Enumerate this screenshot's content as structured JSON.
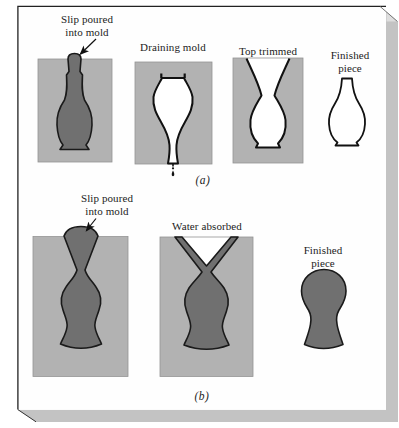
{
  "figure": {
    "row_a": {
      "panels": [
        {
          "label": "Slip poured\ninto mold"
        },
        {
          "label": "Draining mold"
        },
        {
          "label": "Top trimmed"
        },
        {
          "label": "Finished\npiece"
        }
      ],
      "caption": "(a)"
    },
    "row_b": {
      "panels": [
        {
          "label": "Slip poured\ninto mold"
        },
        {
          "label": "Water absorbed"
        },
        {
          "label": "Finished\npiece"
        }
      ],
      "caption": "(b)"
    },
    "colors": {
      "mold_gray": "#b2b2b2",
      "slip_gray": "#707070",
      "outline_black": "#1a1a1a",
      "shadow_gray": "#c3c3c3",
      "bevel_gray": "#dedede",
      "page_white": "#fefefe"
    }
  }
}
